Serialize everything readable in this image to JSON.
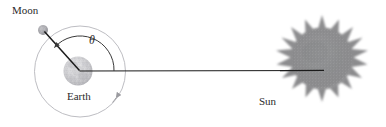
{
  "figure": {
    "background_color": "#ffffff",
    "labels": {
      "moon": "Moon",
      "earth": "Earth",
      "sun": "Sun",
      "angle": "θ"
    },
    "colors": {
      "line": "#1b1b1b",
      "orbit": "#b3b3b8",
      "arc": "#3a3a3a",
      "earth_body": "#c9c9cb",
      "moon_body": "#a9a9ad",
      "sun_body": "#8e8e90",
      "text": "#2b2b2b"
    },
    "geometry": {
      "orbit_center_x": 80,
      "orbit_center_y": 71.5,
      "orbit_radius": 45.5,
      "earth_radius": 14,
      "moon_x": 43,
      "moon_y": 30,
      "moon_radius": 4.5,
      "sun_center_x": 322,
      "sun_center_y": 63,
      "sun_radius": 40,
      "sun_spikes": 20,
      "baseline_y": 71,
      "baseline_x_start": 80,
      "baseline_x_end": 330,
      "angle_arc_radius": 34,
      "angle_degrees": 45
    },
    "annotations": {
      "orbit_direction_arrow": "counterclockwise-orbit-arrow",
      "angle_arc_arrow": "angle-arc-arrow"
    }
  }
}
